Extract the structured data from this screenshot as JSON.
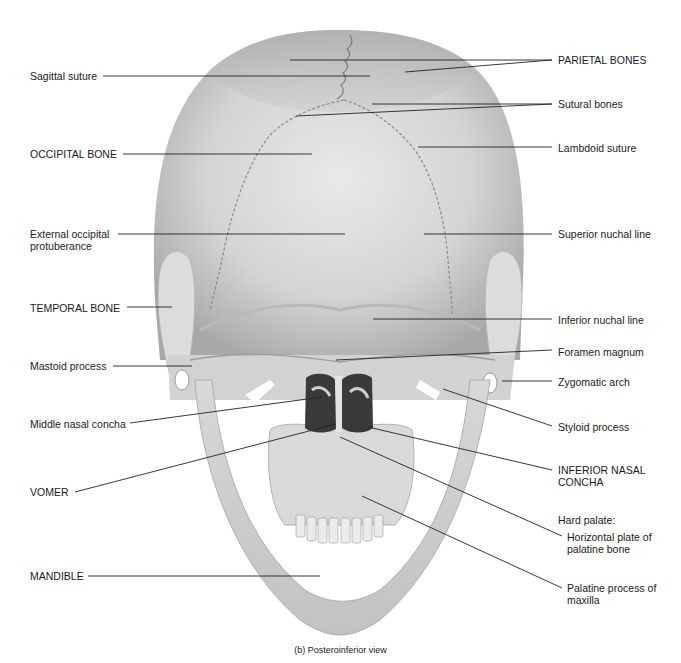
{
  "figure": {
    "caption": "(b) Posteroinferior view",
    "labels_left": [
      {
        "id": "sagittal-suture",
        "lines": [
          "Sagittal suture"
        ],
        "x": 30,
        "y": 70,
        "line": [
          [
            103,
            76
          ],
          [
            370,
            76
          ]
        ]
      },
      {
        "id": "occipital-bone",
        "lines": [
          "OCCIPITAL BONE"
        ],
        "x": 30,
        "y": 148,
        "line": [
          [
            123,
            154
          ],
          [
            312,
            154
          ]
        ]
      },
      {
        "id": "external-occipital-protuberance",
        "lines": [
          "External occipital",
          "protuberance"
        ],
        "x": 30,
        "y": 228,
        "line": [
          [
            118,
            234
          ],
          [
            345,
            234
          ]
        ]
      },
      {
        "id": "temporal-bone",
        "lines": [
          "TEMPORAL BONE"
        ],
        "x": 30,
        "y": 302,
        "line": [
          [
            127,
            307
          ],
          [
            172,
            307
          ]
        ]
      },
      {
        "id": "mastoid-process",
        "lines": [
          "Mastoid process"
        ],
        "x": 30,
        "y": 360,
        "line": [
          [
            113,
            366
          ],
          [
            192,
            366
          ]
        ]
      },
      {
        "id": "middle-nasal-concha",
        "lines": [
          "Middle nasal concha"
        ],
        "x": 30,
        "y": 418,
        "line": [
          [
            130,
            423
          ],
          [
            322,
            397
          ]
        ]
      },
      {
        "id": "vomer",
        "lines": [
          "VOMER"
        ],
        "x": 30,
        "y": 486,
        "line": [
          [
            75,
            492
          ],
          [
            336,
            424
          ]
        ]
      },
      {
        "id": "mandible",
        "lines": [
          "MANDIBLE"
        ],
        "x": 30,
        "y": 570,
        "line": [
          [
            88,
            576
          ],
          [
            320,
            576
          ]
        ]
      }
    ],
    "labels_right": [
      {
        "id": "parietal-bones",
        "lines": [
          "PARIETAL BONES"
        ],
        "x": 558,
        "y": 54,
        "lines_to": [
          [
            [
              552,
              60
            ],
            [
              290,
              60
            ]
          ],
          [
            [
              552,
              60
            ],
            [
              405,
              72
            ]
          ]
        ]
      },
      {
        "id": "sutural-bones",
        "lines": [
          "Sutural bones"
        ],
        "x": 558,
        "y": 98,
        "lines_to": [
          [
            [
              552,
              104
            ],
            [
              372,
              104
            ]
          ],
          [
            [
              552,
              104
            ],
            [
              296,
              116
            ]
          ]
        ]
      },
      {
        "id": "lambdoid-suture",
        "lines": [
          "Lambdoid suture"
        ],
        "x": 558,
        "y": 142,
        "lines_to": [
          [
            [
              552,
              147
            ],
            [
              418,
              147
            ]
          ]
        ]
      },
      {
        "id": "superior-nuchal-line",
        "lines": [
          "Superior nuchal line"
        ],
        "x": 558,
        "y": 228,
        "lines_to": [
          [
            [
              552,
              234
            ],
            [
              424,
              234
            ]
          ]
        ]
      },
      {
        "id": "inferior-nuchal-line",
        "lines": [
          "Inferior nuchal line"
        ],
        "x": 558,
        "y": 314,
        "lines_to": [
          [
            [
              552,
              319
            ],
            [
              373,
              319
            ]
          ]
        ]
      },
      {
        "id": "foramen-magnum",
        "lines": [
          "Foramen magnum"
        ],
        "x": 558,
        "y": 346,
        "lines_to": [
          [
            [
              552,
              350
            ],
            [
              336,
              360
            ]
          ]
        ]
      },
      {
        "id": "zygomatic-arch",
        "lines": [
          "Zygomatic arch"
        ],
        "x": 558,
        "y": 376,
        "lines_to": [
          [
            [
              552,
              381
            ],
            [
              502,
              381
            ]
          ]
        ]
      },
      {
        "id": "styloid-process",
        "lines": [
          "Styloid process"
        ],
        "x": 558,
        "y": 421,
        "lines_to": [
          [
            [
              552,
              426
            ],
            [
              443,
              389
            ]
          ]
        ]
      },
      {
        "id": "inferior-nasal-concha",
        "lines": [
          "INFERIOR NASAL",
          "CONCHA"
        ],
        "x": 558,
        "y": 464,
        "lines_to": [
          [
            [
              552,
              470
            ],
            [
              368,
              427
            ]
          ]
        ]
      },
      {
        "id": "hard-palate",
        "lines": [
          "Hard palate:"
        ],
        "x": 558,
        "y": 514,
        "lines_to": []
      },
      {
        "id": "horizontal-plate",
        "lines": [
          "Horizontal plate of",
          "palatine bone"
        ],
        "x": 567,
        "y": 531,
        "lines_to": [
          [
            [
              562,
              536
            ],
            [
              340,
              437
            ]
          ]
        ]
      },
      {
        "id": "palatine-process",
        "lines": [
          "Palatine process of",
          "maxilla"
        ],
        "x": 567,
        "y": 582,
        "lines_to": [
          [
            [
              562,
              588
            ],
            [
              362,
              496
            ]
          ]
        ]
      }
    ]
  }
}
